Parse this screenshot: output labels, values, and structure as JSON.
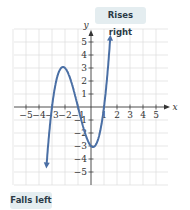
{
  "chart_data": {
    "type": "line",
    "title": "",
    "xlabel": "x",
    "ylabel": "y",
    "xlim": [
      -5.5,
      5.8
    ],
    "ylim": [
      -6,
      6
    ],
    "xticks": [
      -5,
      -4,
      -3,
      -2,
      -1,
      1,
      2,
      3,
      4,
      5
    ],
    "yticks": [
      -5,
      -4,
      -3,
      -2,
      -1,
      1,
      2,
      3,
      4,
      5
    ],
    "grid": true,
    "function": "f(x) = (x+3)(x+1)(x-1)",
    "series": [
      {
        "name": "f(x)",
        "color": "#4a6fa5",
        "x": [
          -3.3,
          -3,
          -2.5,
          -2,
          -1.5,
          -1,
          -0.5,
          0,
          0.5,
          1,
          1.5,
          1.9
        ],
        "y": [
          -5.8,
          0,
          2.6,
          3,
          1.9,
          0,
          -1.9,
          -3,
          -2.6,
          0,
          5.6,
          11
        ]
      }
    ],
    "annotations": [
      {
        "text": "Rises right",
        "x": 1.2,
        "y": 5.5
      },
      {
        "text": "Falls left",
        "x": -3.3,
        "y": -5.8
      }
    ]
  },
  "labels": {
    "rises": "Rises right",
    "falls": "Falls left",
    "x": "x",
    "y": "y"
  }
}
